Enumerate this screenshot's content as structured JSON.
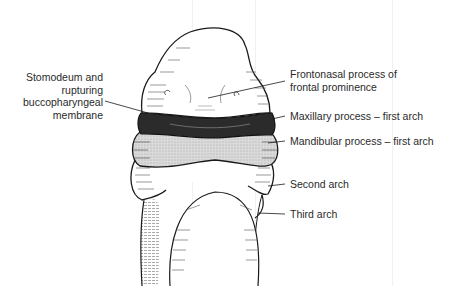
{
  "figure": {
    "colors": {
      "ink": "#1a1a1a",
      "label_text": "#2a2a2a",
      "stomodeum_fill": "#2b2b2b",
      "mandibular_fill": "#d6d6d6",
      "background": "#ffffff"
    },
    "labels": {
      "stomodeum": {
        "line1": "Stomodeum and",
        "line2": "rupturing",
        "line3": "buccopharyngeal",
        "line4": "membrane"
      },
      "frontonasal": {
        "line1": "Frontonasal process of",
        "line2": "frontal prominence"
      },
      "maxillary": "Maxillary process – first arch",
      "mandibular": "Mandibular process – first arch",
      "second_arch": "Second arch",
      "third_arch": "Third arch"
    }
  }
}
